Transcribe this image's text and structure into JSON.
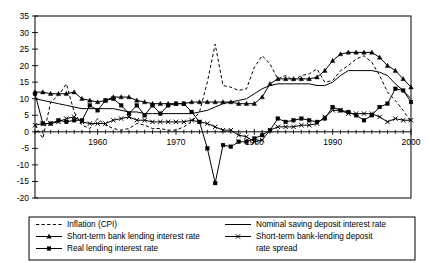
{
  "chart_data": {
    "type": "line",
    "title": "",
    "xlabel": "",
    "ylabel": "",
    "xlim": [
      1952,
      2000
    ],
    "ylim": [
      -20,
      35
    ],
    "ytick_values": [
      -20,
      -15,
      -10,
      -5,
      0,
      5,
      10,
      15,
      20,
      25,
      30,
      35
    ],
    "ytick_labels": [
      "-20",
      "-15",
      "-10",
      "-5",
      "0",
      "5",
      "10",
      "15",
      "20",
      "25",
      "30",
      "35"
    ],
    "xtick_labels": [
      "1960",
      "1970",
      "1980",
      "1990",
      "2000"
    ],
    "xtick_values": [
      1960,
      1970,
      1980,
      1990,
      2000
    ],
    "grid": false,
    "legend_position": "below-plot",
    "x": [
      1952,
      1953,
      1954,
      1955,
      1956,
      1957,
      1958,
      1959,
      1960,
      1961,
      1962,
      1963,
      1964,
      1965,
      1966,
      1967,
      1968,
      1969,
      1970,
      1971,
      1972,
      1973,
      1974,
      1975,
      1976,
      1977,
      1978,
      1979,
      1980,
      1981,
      1982,
      1983,
      1984,
      1985,
      1986,
      1987,
      1988,
      1989,
      1990,
      1991,
      1992,
      1993,
      1994,
      1995,
      1996,
      1997,
      1998,
      1999,
      2000
    ],
    "series": [
      {
        "name": "Inflation (CPI)",
        "style": "dashed",
        "marker": "none",
        "values": [
          2.0,
          -2.0,
          9.0,
          11.0,
          14.5,
          6.0,
          2.0,
          1.0,
          4.0,
          2.0,
          1.0,
          0.5,
          1.0,
          2.5,
          2.0,
          1.0,
          1.0,
          0.5,
          0.5,
          1.5,
          3.0,
          6.0,
          15.0,
          26.5,
          14.0,
          13.5,
          12.5,
          13.0,
          19.5,
          23.0,
          20.5,
          16.0,
          17.0,
          15.5,
          17.0,
          17.5,
          19.0,
          15.0,
          15.5,
          18.5,
          20.0,
          22.0,
          23.0,
          21.0,
          17.0,
          12.0,
          9.5,
          6.5,
          3.0
        ]
      },
      {
        "name": "Short-term bank lending interest rate",
        "style": "solid",
        "marker": "triangle",
        "values": [
          12.0,
          12.0,
          11.5,
          11.5,
          11.5,
          12.0,
          10.0,
          9.5,
          9.0,
          9.5,
          10.5,
          10.5,
          10.5,
          9.5,
          9.0,
          8.5,
          8.5,
          8.5,
          8.5,
          8.5,
          9.0,
          9.0,
          9.0,
          9.0,
          9.0,
          9.0,
          8.5,
          8.5,
          8.5,
          10.5,
          14.5,
          16.0,
          16.0,
          16.0,
          16.0,
          16.0,
          16.5,
          18.5,
          21.5,
          23.5,
          24.0,
          24.0,
          24.0,
          24.0,
          22.5,
          20.0,
          18.5,
          16.0,
          13.5
        ]
      },
      {
        "name": "Real lending interest rate",
        "style": "solid",
        "marker": "square",
        "values": [
          11.5,
          2.5,
          2.5,
          3.5,
          3.0,
          3.5,
          3.5,
          8.0,
          6.5,
          9.5,
          10.0,
          8.0,
          5.5,
          8.0,
          5.0,
          8.0,
          5.5,
          8.0,
          8.5,
          8.5,
          6.0,
          3.0,
          -5.0,
          -15.5,
          -4.0,
          -4.5,
          -3.0,
          -3.0,
          -2.0,
          -1.0,
          0.5,
          4.0,
          3.0,
          3.5,
          4.0,
          3.5,
          3.0,
          4.0,
          7.5,
          6.5,
          6.0,
          5.0,
          3.5,
          5.0,
          7.5,
          8.5,
          13.0,
          12.5,
          9.0
        ]
      },
      {
        "name": "Nominal saving deposit interest rate",
        "style": "solid",
        "marker": "none",
        "values": [
          10.0,
          9.5,
          9.0,
          8.5,
          8.0,
          7.5,
          7.0,
          7.0,
          7.0,
          7.0,
          7.0,
          6.5,
          6.0,
          6.0,
          5.5,
          5.5,
          5.5,
          5.5,
          5.5,
          5.5,
          5.5,
          6.0,
          6.5,
          7.5,
          8.5,
          9.0,
          9.5,
          10.0,
          11.5,
          13.0,
          14.0,
          14.5,
          14.5,
          14.5,
          14.5,
          14.5,
          14.0,
          14.0,
          15.0,
          17.0,
          18.5,
          18.5,
          18.5,
          18.5,
          18.0,
          17.0,
          14.5,
          12.5,
          10.0
        ]
      },
      {
        "name": "Short-term bank-lending deposit rate spread",
        "style": "solid",
        "marker": "x",
        "values": [
          2.0,
          2.5,
          2.5,
          3.0,
          4.0,
          4.5,
          3.0,
          2.5,
          2.5,
          2.5,
          3.5,
          4.0,
          4.5,
          3.5,
          3.5,
          3.0,
          3.0,
          3.0,
          3.0,
          3.0,
          3.5,
          3.0,
          2.5,
          1.5,
          0.5,
          0.5,
          -1.0,
          -1.5,
          -3.0,
          -2.5,
          0.5,
          1.5,
          1.5,
          1.5,
          2.0,
          2.0,
          2.5,
          4.5,
          6.5,
          6.5,
          5.5,
          5.5,
          5.5,
          5.5,
          4.5,
          3.0,
          4.0,
          3.5,
          3.5
        ]
      }
    ]
  },
  "legend": {
    "entries": [
      {
        "label": "Inflation (CPI)",
        "style": "dashed",
        "marker": "none"
      },
      {
        "label": "Short-term bank lending interest rate",
        "style": "solid",
        "marker": "triangle"
      },
      {
        "label": "Real lending interest rate",
        "style": "solid",
        "marker": "square"
      },
      {
        "label": "Nominal saving deposit interest rate",
        "style": "solid",
        "marker": "none"
      },
      {
        "label": "Short-term bank-lending deposit",
        "style": "solid",
        "marker": "x"
      },
      {
        "label": "rate spread",
        "style": "none",
        "marker": "none"
      }
    ]
  },
  "colors": {
    "ink": "#000000",
    "background": "#ffffff"
  }
}
